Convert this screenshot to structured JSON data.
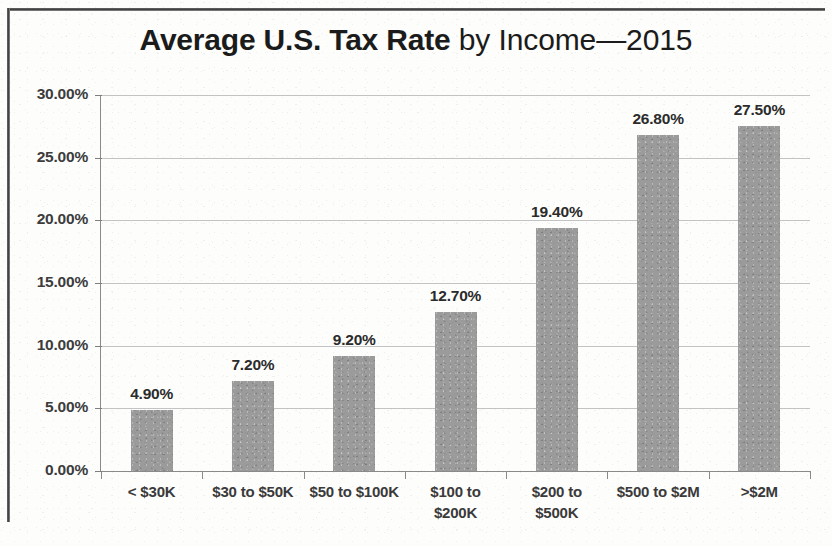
{
  "chart_data": {
    "type": "bar",
    "title": "Average U.S. Tax Rate by Income—2015",
    "title_strong": "Average U.S. Tax Rate",
    "title_light": " by Income—2015",
    "xlabel": "",
    "ylabel": "",
    "ylim": [
      0,
      30
    ],
    "grid": true,
    "legend": "none",
    "y_ticks": [
      "0.00%",
      "5.00%",
      "10.00%",
      "15.00%",
      "20.00%",
      "25.00%",
      "30.00%"
    ],
    "y_tick_values": [
      0,
      5,
      10,
      15,
      20,
      25,
      30
    ],
    "categories": [
      "< $30K",
      "$30 to $50K",
      "$50 to $100K",
      "$100 to $200K",
      "$200 to $500K",
      "$500 to $2M",
      ">$2M"
    ],
    "category_lines": [
      [
        "< $30K"
      ],
      [
        "$30 to $50K"
      ],
      [
        "$50 to $100K"
      ],
      [
        "$100 to",
        "$200K"
      ],
      [
        "$200 to",
        "$500K"
      ],
      [
        "$500 to $2M"
      ],
      [
        ">$2M"
      ]
    ],
    "values": [
      4.9,
      7.2,
      9.2,
      12.7,
      19.4,
      26.8,
      27.5
    ],
    "data_labels": [
      "4.90%",
      "7.20%",
      "9.20%",
      "12.70%",
      "19.40%",
      "26.80%",
      "27.50%"
    ],
    "bar_color": "#9b9b9b",
    "gridline_color": "#b9b9b9",
    "axis_color": "#8a8a8a",
    "text_color": "#2b2b2b",
    "background_color": "#fdfdfc"
  }
}
